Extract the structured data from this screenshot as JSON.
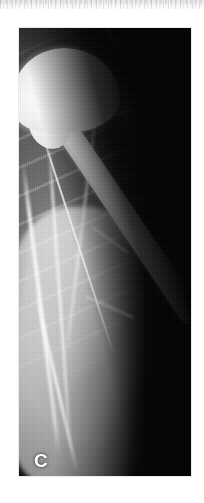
{
  "page": {
    "background_color": "#ffffff",
    "width": 204,
    "height": 503
  },
  "top_bleed": {
    "name": "text-bleed-band",
    "description": "faint grey remnant of the text block above the figure",
    "color": "#e4e4e6"
  },
  "figure": {
    "panel_letter": "C",
    "panel_letter_color": "#ffffff",
    "modality": "radiograph",
    "background_color": "#000000",
    "border_color": "#e9e9ea",
    "frame": {
      "x": 19,
      "y": 28,
      "width": 172,
      "height": 448
    },
    "regions": [
      {
        "name": "humeral-head-prosthesis",
        "label": "Humeral head component",
        "tone": "#ffffff"
      },
      {
        "name": "prosthetic-stem",
        "label": "Intramedullary stem",
        "tone": "#ffffff"
      },
      {
        "name": "scapula-glenoid",
        "label": "Scapula / glenoid / coracoid",
        "tone": "#e8e8e8"
      },
      {
        "name": "rib-shadows",
        "label": "Rib shadows",
        "tone": "#c8c8c8"
      },
      {
        "name": "humeral-shaft-soft-tissue",
        "label": "Humeral shaft and soft tissue",
        "tone": "#c4c4c4"
      },
      {
        "name": "background-field",
        "label": "Exposed background",
        "tone": "#000000"
      }
    ]
  }
}
